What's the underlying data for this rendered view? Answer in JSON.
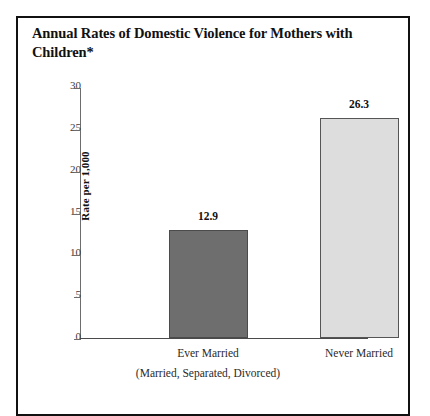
{
  "figure": {
    "title": "Annual Rates of Domestic Violence for Mothers with Children*",
    "frame_color": "#111111",
    "background": "#ffffff"
  },
  "chart_data": {
    "type": "bar",
    "title": "Annual Rates of Domestic Violence for Mothers with Children*",
    "xlabel": "",
    "ylabel": "Rate per 1,000",
    "ylim": [
      0,
      30
    ],
    "ytick_labels": [
      "30",
      "25",
      "20",
      "15",
      "10",
      "5",
      "0"
    ],
    "ytick_values": [
      30,
      25,
      20,
      15,
      10,
      5,
      0
    ],
    "ytick_step": 5,
    "grid": false,
    "legend": "none",
    "categories": [
      "Ever Married",
      "Never Married"
    ],
    "category_sublabels": [
      "(Married, Separated, Divorced)",
      ""
    ],
    "values": [
      12.9,
      26.3
    ],
    "value_labels": [
      "12.9",
      "26.3"
    ],
    "bar_colors": [
      "#6e6e6e",
      "#dddddd"
    ],
    "bar_edge_colors": [
      "#4b4b4b",
      "#555555"
    ]
  },
  "axis": {
    "y_title": "Rate per 1,000",
    "y_axis_color": "#6d6d6d",
    "x_axis_color": "#4a4a4a"
  }
}
